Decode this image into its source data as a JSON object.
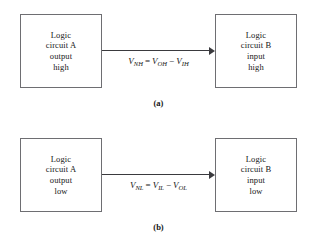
{
  "figure": {
    "panels": [
      {
        "id": "a",
        "caption": "(a)",
        "left_box": {
          "lines": [
            "Logic",
            "circuit A",
            "output",
            "high"
          ]
        },
        "right_box": {
          "lines": [
            "Logic",
            "circuit B",
            "input",
            "high"
          ]
        },
        "equation": {
          "lhs_symbol": "V",
          "lhs_sub": "NH",
          "equals": "=",
          "term1_symbol": "V",
          "term1_sub": "OH",
          "operator": "−",
          "term2_symbol": "V",
          "term2_sub": "IH",
          "plain": "V_NH = V_OH − V_IH"
        },
        "arrow_direction": "left-to-right"
      },
      {
        "id": "b",
        "caption": "(b)",
        "left_box": {
          "lines": [
            "Logic",
            "circuit A",
            "output",
            "low"
          ]
        },
        "right_box": {
          "lines": [
            "Logic",
            "circuit B",
            "input",
            "low"
          ]
        },
        "equation": {
          "lhs_symbol": "V",
          "lhs_sub": "NL",
          "equals": "=",
          "term1_symbol": "V",
          "term1_sub": "IL",
          "operator": "−",
          "term2_symbol": "V",
          "term2_sub": "OL",
          "plain": "V_NL = V_IL − V_OL"
        },
        "arrow_direction": "left-to-right"
      }
    ]
  },
  "colors": {
    "background": "#ffffff",
    "box_border": "#6e6e72",
    "arrow": "#3a3a3e",
    "text": "#161616"
  }
}
